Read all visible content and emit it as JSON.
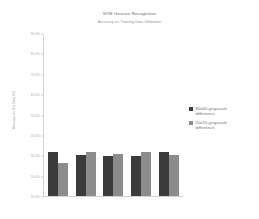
{
  "chart_data": {
    "type": "bar",
    "title": "SVM Gesture Recognition",
    "subtitle": "Accuracy vs. Training Data Utilization",
    "xlabel": "",
    "ylabel": "Accuracy on Test Data (%)",
    "ylim": [
      10,
      90
    ],
    "grid": false,
    "legend_position": "right",
    "categories": [
      "1",
      "2",
      "3",
      "4",
      "5"
    ],
    "ytick_labels": [
      "90.0%",
      "80.0%",
      "70.0%",
      "60.0%",
      "50.0%",
      "40.0%",
      "30.0%",
      "20.0%",
      "10.0%"
    ],
    "ytick_values": [
      90,
      80,
      70,
      60,
      50,
      40,
      30,
      20,
      10
    ],
    "series": [
      {
        "name": "80x60 grayscale difference",
        "color": "#3b3b3b",
        "values": [
          31.8,
          30.5,
          30.0,
          29.6,
          31.9
        ]
      },
      {
        "name": "20x15 grayscale difference",
        "color": "#8c8c8c",
        "values": [
          26.3,
          31.7,
          30.8,
          31.6,
          30.2
        ]
      }
    ]
  },
  "legend": {
    "items": [
      {
        "label_line1": "80x60 grayscale",
        "label_line2": "difference"
      },
      {
        "label_line1": "20x15 grayscale",
        "label_line2": "difference"
      }
    ]
  }
}
